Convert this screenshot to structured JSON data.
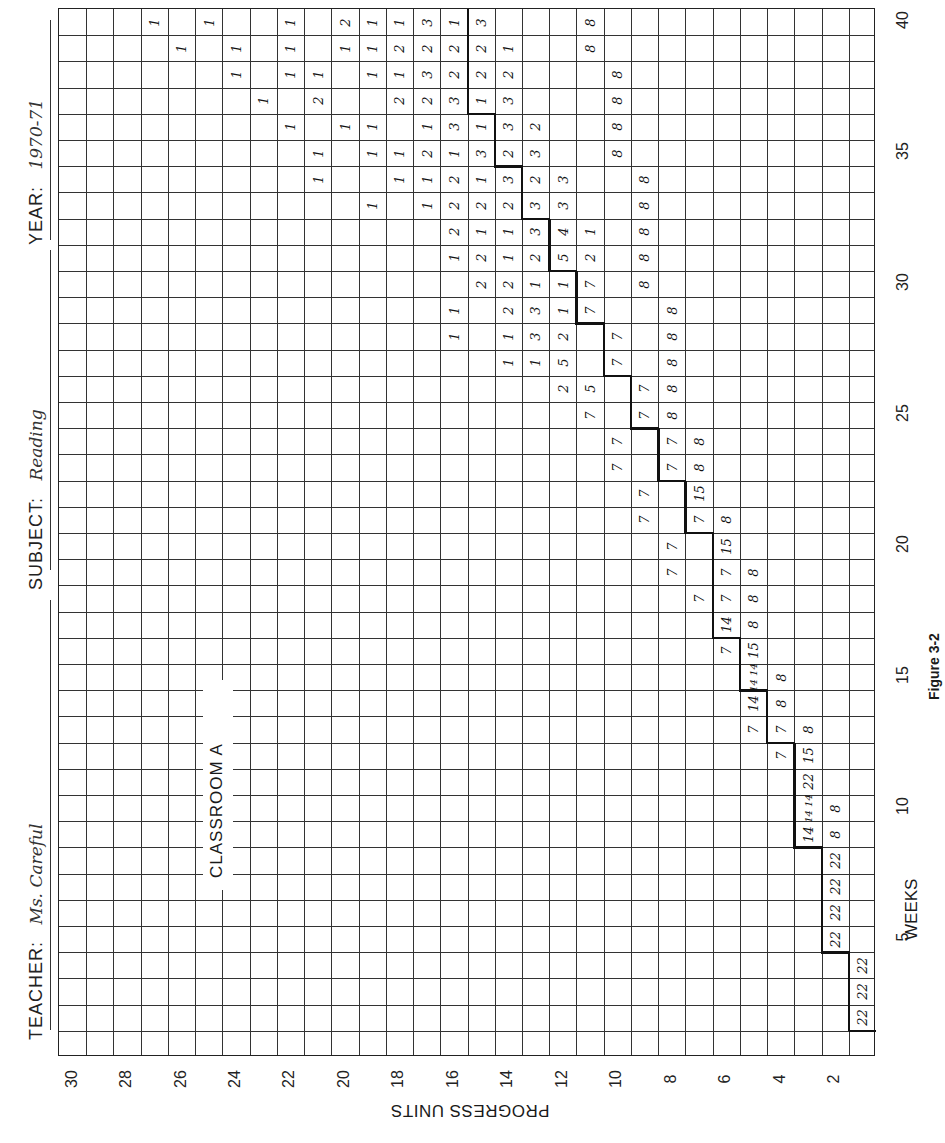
{
  "header": {
    "teacher_label": "TEACHER:",
    "teacher_value": "Ms. Careful",
    "subject_label": "SUBJECT:",
    "subject_value": "Reading",
    "year_label": "YEAR:",
    "year_value": "1970-71"
  },
  "classroom_label": "CLASSROOM A",
  "figure_caption": "Figure 3-2",
  "chart_data": {
    "type": "table",
    "orientation": "rotated 90° counter-clockwise: weeks along vertical axis (1 bottom → 40 top), progress units along horizontal axis (1 right → 30 left)",
    "xlabel": "WEEKS",
    "ylabel": "PROGRESS UNITS",
    "weeks_range": [
      1,
      40
    ],
    "units_range": [
      1,
      30
    ],
    "week_ticks": [
      "5",
      "10",
      "15",
      "20",
      "25",
      "30",
      "35",
      "40"
    ],
    "unit_ticks": [
      "2",
      "4",
      "6",
      "8",
      "10",
      "12",
      "14",
      "16",
      "18",
      "20",
      "22",
      "24",
      "26",
      "28",
      "30"
    ],
    "grid": true,
    "cell_meaning": "number of students who completed the given progress unit in the given week",
    "expected_progress_step": [
      {
        "weeks": [
          2,
          4
        ],
        "unit": 1
      },
      {
        "weeks": [
          5,
          8
        ],
        "unit": 2
      },
      {
        "weeks": [
          9,
          12
        ],
        "unit": 3
      },
      {
        "weeks": [
          13,
          14
        ],
        "unit": 4
      },
      {
        "weeks": [
          15,
          16
        ],
        "unit": 5
      },
      {
        "weeks": [
          17,
          20
        ],
        "unit": 6
      },
      {
        "weeks": [
          21,
          22
        ],
        "unit": 7
      },
      {
        "weeks": [
          23,
          24
        ],
        "unit": 8
      },
      {
        "weeks": [
          25,
          26
        ],
        "unit": 9
      },
      {
        "weeks": [
          27,
          28
        ],
        "unit": 10
      },
      {
        "weeks": [
          29,
          30
        ],
        "unit": 11
      },
      {
        "weeks": [
          31,
          32
        ],
        "unit": 12
      },
      {
        "weeks": [
          33,
          34
        ],
        "unit": 13
      },
      {
        "weeks": [
          35,
          36
        ],
        "unit": 14
      },
      {
        "weeks": [
          37,
          38
        ],
        "unit": 15
      },
      {
        "weeks": [
          39,
          40
        ],
        "unit": 15
      }
    ],
    "entries": [
      {
        "week": 2,
        "unit": 1,
        "value": "22"
      },
      {
        "week": 3,
        "unit": 1,
        "value": "22"
      },
      {
        "week": 4,
        "unit": 1,
        "value": "22"
      },
      {
        "week": 5,
        "unit": 2,
        "value": "22"
      },
      {
        "week": 6,
        "unit": 2,
        "value": "22"
      },
      {
        "week": 7,
        "unit": 2,
        "value": "22"
      },
      {
        "week": 8,
        "unit": 2,
        "value": "22"
      },
      {
        "week": 9,
        "unit": 3,
        "value": "14"
      },
      {
        "week": 9,
        "unit": 2,
        "value": "8"
      },
      {
        "week": 10,
        "unit": 3,
        "value": "14 14"
      },
      {
        "week": 10,
        "unit": 2,
        "value": "8"
      },
      {
        "week": 11,
        "unit": 3,
        "value": "22"
      },
      {
        "week": 12,
        "unit": 4,
        "value": "7"
      },
      {
        "week": 12,
        "unit": 3,
        "value": "15"
      },
      {
        "week": 13,
        "unit": 5,
        "value": "7"
      },
      {
        "week": 13,
        "unit": 4,
        "value": "7"
      },
      {
        "week": 13,
        "unit": 3,
        "value": "8"
      },
      {
        "week": 14,
        "unit": 5,
        "value": "14"
      },
      {
        "week": 14,
        "unit": 4,
        "value": "8"
      },
      {
        "week": 15,
        "unit": 5,
        "value": "14 14"
      },
      {
        "week": 15,
        "unit": 4,
        "value": "8"
      },
      {
        "week": 16,
        "unit": 6,
        "value": "7"
      },
      {
        "week": 16,
        "unit": 5,
        "value": "15"
      },
      {
        "week": 17,
        "unit": 6,
        "value": "14"
      },
      {
        "week": 17,
        "unit": 5,
        "value": "8"
      },
      {
        "week": 18,
        "unit": 7,
        "value": "7"
      },
      {
        "week": 18,
        "unit": 6,
        "value": "7"
      },
      {
        "week": 18,
        "unit": 5,
        "value": "8"
      },
      {
        "week": 19,
        "unit": 8,
        "value": "7"
      },
      {
        "week": 19,
        "unit": 6,
        "value": "7"
      },
      {
        "week": 19,
        "unit": 5,
        "value": "8"
      },
      {
        "week": 20,
        "unit": 8,
        "value": "7"
      },
      {
        "week": 20,
        "unit": 6,
        "value": "15"
      },
      {
        "week": 21,
        "unit": 9,
        "value": "7"
      },
      {
        "week": 21,
        "unit": 7,
        "value": "7"
      },
      {
        "week": 21,
        "unit": 6,
        "value": "8"
      },
      {
        "week": 22,
        "unit": 9,
        "value": "7"
      },
      {
        "week": 22,
        "unit": 7,
        "value": "15"
      },
      {
        "week": 23,
        "unit": 10,
        "value": "7"
      },
      {
        "week": 23,
        "unit": 8,
        "value": "7"
      },
      {
        "week": 23,
        "unit": 7,
        "value": "8"
      },
      {
        "week": 24,
        "unit": 10,
        "value": "7"
      },
      {
        "week": 24,
        "unit": 8,
        "value": "7"
      },
      {
        "week": 24,
        "unit": 7,
        "value": "8"
      },
      {
        "week": 25,
        "unit": 11,
        "value": "7"
      },
      {
        "week": 25,
        "unit": 9,
        "value": "7"
      },
      {
        "week": 25,
        "unit": 8,
        "value": "8"
      },
      {
        "week": 26,
        "unit": 12,
        "value": "2"
      },
      {
        "week": 26,
        "unit": 11,
        "value": "5"
      },
      {
        "week": 26,
        "unit": 9,
        "value": "7"
      },
      {
        "week": 26,
        "unit": 8,
        "value": "8"
      },
      {
        "week": 27,
        "unit": 14,
        "value": "1"
      },
      {
        "week": 27,
        "unit": 13,
        "value": "1"
      },
      {
        "week": 27,
        "unit": 12,
        "value": "5"
      },
      {
        "week": 27,
        "unit": 10,
        "value": "7"
      },
      {
        "week": 27,
        "unit": 8,
        "value": "8"
      },
      {
        "week": 28,
        "unit": 16,
        "value": "1"
      },
      {
        "week": 28,
        "unit": 14,
        "value": "1"
      },
      {
        "week": 28,
        "unit": 13,
        "value": "3"
      },
      {
        "week": 28,
        "unit": 12,
        "value": "2"
      },
      {
        "week": 28,
        "unit": 10,
        "value": "7"
      },
      {
        "week": 28,
        "unit": 8,
        "value": "8"
      },
      {
        "week": 29,
        "unit": 16,
        "value": "1"
      },
      {
        "week": 29,
        "unit": 14,
        "value": "2"
      },
      {
        "week": 29,
        "unit": 13,
        "value": "3"
      },
      {
        "week": 29,
        "unit": 12,
        "value": "1"
      },
      {
        "week": 29,
        "unit": 11,
        "value": "7"
      },
      {
        "week": 29,
        "unit": 8,
        "value": "8"
      },
      {
        "week": 30,
        "unit": 15,
        "value": "2"
      },
      {
        "week": 30,
        "unit": 14,
        "value": "2"
      },
      {
        "week": 30,
        "unit": 13,
        "value": "1"
      },
      {
        "week": 30,
        "unit": 12,
        "value": "1"
      },
      {
        "week": 30,
        "unit": 11,
        "value": "7"
      },
      {
        "week": 30,
        "unit": 9,
        "value": "8"
      },
      {
        "week": 31,
        "unit": 16,
        "value": "1"
      },
      {
        "week": 31,
        "unit": 15,
        "value": "2"
      },
      {
        "week": 31,
        "unit": 14,
        "value": "1"
      },
      {
        "week": 31,
        "unit": 13,
        "value": "2"
      },
      {
        "week": 31,
        "unit": 12,
        "value": "5"
      },
      {
        "week": 31,
        "unit": 11,
        "value": "2"
      },
      {
        "week": 31,
        "unit": 9,
        "value": "8"
      },
      {
        "week": 32,
        "unit": 16,
        "value": "2"
      },
      {
        "week": 32,
        "unit": 15,
        "value": "1"
      },
      {
        "week": 32,
        "unit": 14,
        "value": "1"
      },
      {
        "week": 32,
        "unit": 13,
        "value": "3"
      },
      {
        "week": 32,
        "unit": 12,
        "value": "4"
      },
      {
        "week": 32,
        "unit": 11,
        "value": "1"
      },
      {
        "week": 32,
        "unit": 9,
        "value": "8"
      },
      {
        "week": 33,
        "unit": 19,
        "value": "1"
      },
      {
        "week": 33,
        "unit": 17,
        "value": "1"
      },
      {
        "week": 33,
        "unit": 16,
        "value": "2"
      },
      {
        "week": 33,
        "unit": 15,
        "value": "2"
      },
      {
        "week": 33,
        "unit": 14,
        "value": "2"
      },
      {
        "week": 33,
        "unit": 13,
        "value": "3"
      },
      {
        "week": 33,
        "unit": 12,
        "value": "3"
      },
      {
        "week": 33,
        "unit": 9,
        "value": "8"
      },
      {
        "week": 34,
        "unit": 21,
        "value": "1"
      },
      {
        "week": 34,
        "unit": 18,
        "value": "1"
      },
      {
        "week": 34,
        "unit": 17,
        "value": "1"
      },
      {
        "week": 34,
        "unit": 16,
        "value": "2"
      },
      {
        "week": 34,
        "unit": 15,
        "value": "1"
      },
      {
        "week": 34,
        "unit": 14,
        "value": "3"
      },
      {
        "week": 34,
        "unit": 13,
        "value": "2"
      },
      {
        "week": 34,
        "unit": 12,
        "value": "3"
      },
      {
        "week": 34,
        "unit": 9,
        "value": "8"
      },
      {
        "week": 35,
        "unit": 21,
        "value": "1"
      },
      {
        "week": 35,
        "unit": 19,
        "value": "1"
      },
      {
        "week": 35,
        "unit": 18,
        "value": "1"
      },
      {
        "week": 35,
        "unit": 17,
        "value": "2"
      },
      {
        "week": 35,
        "unit": 16,
        "value": "1"
      },
      {
        "week": 35,
        "unit": 15,
        "value": "3"
      },
      {
        "week": 35,
        "unit": 14,
        "value": "2"
      },
      {
        "week": 35,
        "unit": 13,
        "value": "3"
      },
      {
        "week": 35,
        "unit": 10,
        "value": "8"
      },
      {
        "week": 36,
        "unit": 22,
        "value": "1"
      },
      {
        "week": 36,
        "unit": 20,
        "value": "1"
      },
      {
        "week": 36,
        "unit": 19,
        "value": "1"
      },
      {
        "week": 36,
        "unit": 17,
        "value": "1"
      },
      {
        "week": 36,
        "unit": 16,
        "value": "3"
      },
      {
        "week": 36,
        "unit": 15,
        "value": "1"
      },
      {
        "week": 36,
        "unit": 14,
        "value": "3"
      },
      {
        "week": 36,
        "unit": 13,
        "value": "2"
      },
      {
        "week": 36,
        "unit": 10,
        "value": "8"
      },
      {
        "week": 37,
        "unit": 23,
        "value": "1"
      },
      {
        "week": 37,
        "unit": 21,
        "value": "2"
      },
      {
        "week": 37,
        "unit": 18,
        "value": "2"
      },
      {
        "week": 37,
        "unit": 17,
        "value": "2"
      },
      {
        "week": 37,
        "unit": 16,
        "value": "3"
      },
      {
        "week": 37,
        "unit": 15,
        "value": "1"
      },
      {
        "week": 37,
        "unit": 14,
        "value": "3"
      },
      {
        "week": 37,
        "unit": 10,
        "value": "8"
      },
      {
        "week": 38,
        "unit": 24,
        "value": "1"
      },
      {
        "week": 38,
        "unit": 22,
        "value": "1"
      },
      {
        "week": 38,
        "unit": 21,
        "value": "1"
      },
      {
        "week": 38,
        "unit": 19,
        "value": "1"
      },
      {
        "week": 38,
        "unit": 18,
        "value": "1"
      },
      {
        "week": 38,
        "unit": 17,
        "value": "3"
      },
      {
        "week": 38,
        "unit": 16,
        "value": "2"
      },
      {
        "week": 38,
        "unit": 15,
        "value": "2"
      },
      {
        "week": 38,
        "unit": 14,
        "value": "2"
      },
      {
        "week": 38,
        "unit": 10,
        "value": "8"
      },
      {
        "week": 39,
        "unit": 26,
        "value": "1"
      },
      {
        "week": 39,
        "unit": 24,
        "value": "1"
      },
      {
        "week": 39,
        "unit": 22,
        "value": "1"
      },
      {
        "week": 39,
        "unit": 20,
        "value": "1"
      },
      {
        "week": 39,
        "unit": 19,
        "value": "1"
      },
      {
        "week": 39,
        "unit": 18,
        "value": "2"
      },
      {
        "week": 39,
        "unit": 17,
        "value": "2"
      },
      {
        "week": 39,
        "unit": 16,
        "value": "2"
      },
      {
        "week": 39,
        "unit": 15,
        "value": "2"
      },
      {
        "week": 39,
        "unit": 14,
        "value": "1"
      },
      {
        "week": 39,
        "unit": 11,
        "value": "8"
      },
      {
        "week": 40,
        "unit": 27,
        "value": "1"
      },
      {
        "week": 40,
        "unit": 25,
        "value": "1"
      },
      {
        "week": 40,
        "unit": 22,
        "value": "1"
      },
      {
        "week": 40,
        "unit": 20,
        "value": "2"
      },
      {
        "week": 40,
        "unit": 19,
        "value": "1"
      },
      {
        "week": 40,
        "unit": 18,
        "value": "1"
      },
      {
        "week": 40,
        "unit": 17,
        "value": "3"
      },
      {
        "week": 40,
        "unit": 16,
        "value": "1"
      },
      {
        "week": 40,
        "unit": 15,
        "value": "3"
      },
      {
        "week": 40,
        "unit": 11,
        "value": "8"
      }
    ]
  },
  "colors": {
    "ink": "#111111",
    "grid": "#333333",
    "paper": "#ffffff"
  }
}
